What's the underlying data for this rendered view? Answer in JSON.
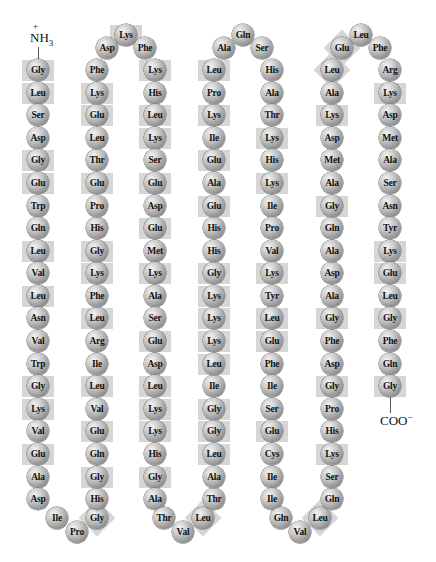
{
  "figure": {
    "n_terminus": {
      "label": "NH",
      "sub": "3",
      "charge": "+"
    },
    "c_terminus": {
      "label": "COO",
      "charge": "−"
    },
    "highlight_color": "#cfcfcf",
    "bead_color": "#a8a8a8",
    "residues": [
      {
        "aa": "Gly",
        "x": 38,
        "y": 70,
        "hl": true
      },
      {
        "aa": "Leu",
        "x": 38,
        "y": 93,
        "hl": true
      },
      {
        "aa": "Ser",
        "x": 38,
        "y": 115,
        "hl": false
      },
      {
        "aa": "Asp",
        "x": 38,
        "y": 138,
        "hl": false
      },
      {
        "aa": "Gly",
        "x": 38,
        "y": 160,
        "hl": true
      },
      {
        "aa": "Glu",
        "x": 38,
        "y": 183,
        "hl": true
      },
      {
        "aa": "Trp",
        "x": 38,
        "y": 206,
        "hl": false
      },
      {
        "aa": "Gln",
        "x": 38,
        "y": 228,
        "hl": false
      },
      {
        "aa": "Leu",
        "x": 38,
        "y": 251,
        "hl": true
      },
      {
        "aa": "Val",
        "x": 38,
        "y": 273,
        "hl": false
      },
      {
        "aa": "Leu",
        "x": 38,
        "y": 296,
        "hl": true
      },
      {
        "aa": "Asn",
        "x": 38,
        "y": 318,
        "hl": false
      },
      {
        "aa": "Val",
        "x": 38,
        "y": 341,
        "hl": false
      },
      {
        "aa": "Trp",
        "x": 38,
        "y": 364,
        "hl": false
      },
      {
        "aa": "Gly",
        "x": 38,
        "y": 386,
        "hl": true
      },
      {
        "aa": "Lys",
        "x": 38,
        "y": 409,
        "hl": true
      },
      {
        "aa": "Val",
        "x": 38,
        "y": 431,
        "hl": false
      },
      {
        "aa": "Glu",
        "x": 38,
        "y": 454,
        "hl": true
      },
      {
        "aa": "Ala",
        "x": 38,
        "y": 477,
        "hl": false
      },
      {
        "aa": "Asp",
        "x": 38,
        "y": 499,
        "hl": false
      },
      {
        "aa": "Ile",
        "x": 57,
        "y": 518,
        "hl": false
      },
      {
        "aa": "Pro",
        "x": 77,
        "y": 532,
        "hl": false
      },
      {
        "aa": "Gly",
        "x": 97,
        "y": 518,
        "hl": true,
        "rot": true
      },
      {
        "aa": "His",
        "x": 97,
        "y": 499,
        "hl": false
      },
      {
        "aa": "Gly",
        "x": 97,
        "y": 477,
        "hl": true
      },
      {
        "aa": "Gln",
        "x": 97,
        "y": 454,
        "hl": false
      },
      {
        "aa": "Glu",
        "x": 97,
        "y": 431,
        "hl": true
      },
      {
        "aa": "Val",
        "x": 97,
        "y": 409,
        "hl": false
      },
      {
        "aa": "Leu",
        "x": 97,
        "y": 386,
        "hl": true
      },
      {
        "aa": "Ile",
        "x": 97,
        "y": 364,
        "hl": false
      },
      {
        "aa": "Arg",
        "x": 97,
        "y": 341,
        "hl": false
      },
      {
        "aa": "Leu",
        "x": 97,
        "y": 318,
        "hl": true
      },
      {
        "aa": "Phe",
        "x": 97,
        "y": 296,
        "hl": false
      },
      {
        "aa": "Lys",
        "x": 97,
        "y": 273,
        "hl": true
      },
      {
        "aa": "Gly",
        "x": 97,
        "y": 251,
        "hl": true
      },
      {
        "aa": "His",
        "x": 97,
        "y": 228,
        "hl": false
      },
      {
        "aa": "Pro",
        "x": 97,
        "y": 206,
        "hl": false
      },
      {
        "aa": "Glu",
        "x": 97,
        "y": 183,
        "hl": true
      },
      {
        "aa": "Thr",
        "x": 97,
        "y": 160,
        "hl": false
      },
      {
        "aa": "Leu",
        "x": 97,
        "y": 138,
        "hl": false
      },
      {
        "aa": "Glu",
        "x": 97,
        "y": 115,
        "hl": true
      },
      {
        "aa": "Lys",
        "x": 97,
        "y": 93,
        "hl": true
      },
      {
        "aa": "Phe",
        "x": 97,
        "y": 70,
        "hl": false
      },
      {
        "aa": "Asp",
        "x": 107,
        "y": 48,
        "hl": false
      },
      {
        "aa": "Lys",
        "x": 126,
        "y": 35,
        "hl": true
      },
      {
        "aa": "Phe",
        "x": 145,
        "y": 48,
        "hl": false
      },
      {
        "aa": "Lys",
        "x": 155,
        "y": 70,
        "hl": true
      },
      {
        "aa": "His",
        "x": 155,
        "y": 93,
        "hl": false
      },
      {
        "aa": "Leu",
        "x": 155,
        "y": 115,
        "hl": true
      },
      {
        "aa": "Lys",
        "x": 155,
        "y": 138,
        "hl": true
      },
      {
        "aa": "Ser",
        "x": 155,
        "y": 160,
        "hl": false
      },
      {
        "aa": "Glu",
        "x": 155,
        "y": 183,
        "hl": true
      },
      {
        "aa": "Asp",
        "x": 155,
        "y": 206,
        "hl": false
      },
      {
        "aa": "Glu",
        "x": 155,
        "y": 228,
        "hl": true
      },
      {
        "aa": "Met",
        "x": 155,
        "y": 251,
        "hl": false
      },
      {
        "aa": "Lys",
        "x": 155,
        "y": 273,
        "hl": true
      },
      {
        "aa": "Ala",
        "x": 155,
        "y": 296,
        "hl": false
      },
      {
        "aa": "Ser",
        "x": 155,
        "y": 318,
        "hl": false
      },
      {
        "aa": "Glu",
        "x": 155,
        "y": 341,
        "hl": true
      },
      {
        "aa": "Asp",
        "x": 155,
        "y": 364,
        "hl": false
      },
      {
        "aa": "Leu",
        "x": 155,
        "y": 386,
        "hl": true
      },
      {
        "aa": "Lys",
        "x": 155,
        "y": 409,
        "hl": true
      },
      {
        "aa": "Lys",
        "x": 155,
        "y": 431,
        "hl": true
      },
      {
        "aa": "His",
        "x": 155,
        "y": 454,
        "hl": false
      },
      {
        "aa": "Gly",
        "x": 155,
        "y": 477,
        "hl": true
      },
      {
        "aa": "Ala",
        "x": 155,
        "y": 499,
        "hl": false
      },
      {
        "aa": "Thr",
        "x": 164,
        "y": 518,
        "hl": false
      },
      {
        "aa": "Val",
        "x": 183,
        "y": 532,
        "hl": false
      },
      {
        "aa": "Leu",
        "x": 203,
        "y": 518,
        "hl": true,
        "rot": true
      },
      {
        "aa": "Thr",
        "x": 214,
        "y": 499,
        "hl": false
      },
      {
        "aa": "Ala",
        "x": 214,
        "y": 477,
        "hl": false
      },
      {
        "aa": "Leu",
        "x": 214,
        "y": 454,
        "hl": true
      },
      {
        "aa": "Gly",
        "x": 214,
        "y": 431,
        "hl": true
      },
      {
        "aa": "Gly",
        "x": 214,
        "y": 409,
        "hl": true
      },
      {
        "aa": "Ile",
        "x": 214,
        "y": 386,
        "hl": false
      },
      {
        "aa": "Leu",
        "x": 214,
        "y": 364,
        "hl": true
      },
      {
        "aa": "Lys",
        "x": 214,
        "y": 341,
        "hl": true
      },
      {
        "aa": "Lys",
        "x": 214,
        "y": 318,
        "hl": true
      },
      {
        "aa": "Lys",
        "x": 214,
        "y": 296,
        "hl": true
      },
      {
        "aa": "Gly",
        "x": 214,
        "y": 273,
        "hl": true
      },
      {
        "aa": "His",
        "x": 214,
        "y": 251,
        "hl": false
      },
      {
        "aa": "His",
        "x": 214,
        "y": 228,
        "hl": false
      },
      {
        "aa": "Glu",
        "x": 214,
        "y": 206,
        "hl": true
      },
      {
        "aa": "Ala",
        "x": 214,
        "y": 183,
        "hl": false
      },
      {
        "aa": "Glu",
        "x": 214,
        "y": 160,
        "hl": true
      },
      {
        "aa": "Ile",
        "x": 214,
        "y": 138,
        "hl": false
      },
      {
        "aa": "Lys",
        "x": 214,
        "y": 115,
        "hl": true
      },
      {
        "aa": "Pro",
        "x": 214,
        "y": 93,
        "hl": false
      },
      {
        "aa": "Leu",
        "x": 214,
        "y": 70,
        "hl": true
      },
      {
        "aa": "Ala",
        "x": 224,
        "y": 48,
        "hl": false
      },
      {
        "aa": "Gln",
        "x": 243,
        "y": 35,
        "hl": false
      },
      {
        "aa": "Ser",
        "x": 262,
        "y": 48,
        "hl": false
      },
      {
        "aa": "His",
        "x": 272,
        "y": 70,
        "hl": false
      },
      {
        "aa": "Ala",
        "x": 272,
        "y": 93,
        "hl": false
      },
      {
        "aa": "Thr",
        "x": 272,
        "y": 115,
        "hl": false
      },
      {
        "aa": "Lys",
        "x": 272,
        "y": 138,
        "hl": true
      },
      {
        "aa": "His",
        "x": 272,
        "y": 160,
        "hl": false
      },
      {
        "aa": "Lys",
        "x": 272,
        "y": 183,
        "hl": true
      },
      {
        "aa": "Ile",
        "x": 272,
        "y": 206,
        "hl": false
      },
      {
        "aa": "Pro",
        "x": 272,
        "y": 228,
        "hl": false
      },
      {
        "aa": "Val",
        "x": 272,
        "y": 251,
        "hl": false
      },
      {
        "aa": "Lys",
        "x": 272,
        "y": 273,
        "hl": true
      },
      {
        "aa": "Tyr",
        "x": 272,
        "y": 296,
        "hl": false
      },
      {
        "aa": "Leu",
        "x": 272,
        "y": 318,
        "hl": true
      },
      {
        "aa": "Glu",
        "x": 272,
        "y": 341,
        "hl": true
      },
      {
        "aa": "Phe",
        "x": 272,
        "y": 364,
        "hl": false
      },
      {
        "aa": "Ile",
        "x": 272,
        "y": 386,
        "hl": false
      },
      {
        "aa": "Ser",
        "x": 272,
        "y": 409,
        "hl": false
      },
      {
        "aa": "Glu",
        "x": 272,
        "y": 431,
        "hl": true
      },
      {
        "aa": "Cys",
        "x": 272,
        "y": 454,
        "hl": false
      },
      {
        "aa": "Ile",
        "x": 272,
        "y": 477,
        "hl": false
      },
      {
        "aa": "Ile",
        "x": 272,
        "y": 499,
        "hl": false
      },
      {
        "aa": "Gln",
        "x": 281,
        "y": 518,
        "hl": false
      },
      {
        "aa": "Val",
        "x": 300,
        "y": 532,
        "hl": false
      },
      {
        "aa": "Leu",
        "x": 320,
        "y": 518,
        "hl": true,
        "rot": true
      },
      {
        "aa": "Gln",
        "x": 332,
        "y": 499,
        "hl": false
      },
      {
        "aa": "Ser",
        "x": 332,
        "y": 477,
        "hl": false
      },
      {
        "aa": "Lys",
        "x": 332,
        "y": 454,
        "hl": true
      },
      {
        "aa": "His",
        "x": 332,
        "y": 431,
        "hl": false
      },
      {
        "aa": "Pro",
        "x": 332,
        "y": 409,
        "hl": false
      },
      {
        "aa": "Gly",
        "x": 332,
        "y": 386,
        "hl": true
      },
      {
        "aa": "Asp",
        "x": 332,
        "y": 364,
        "hl": false
      },
      {
        "aa": "Phe",
        "x": 332,
        "y": 341,
        "hl": false
      },
      {
        "aa": "Gly",
        "x": 332,
        "y": 318,
        "hl": true
      },
      {
        "aa": "Ala",
        "x": 332,
        "y": 296,
        "hl": false
      },
      {
        "aa": "Asp",
        "x": 332,
        "y": 273,
        "hl": false
      },
      {
        "aa": "Ala",
        "x": 332,
        "y": 251,
        "hl": false
      },
      {
        "aa": "Gln",
        "x": 332,
        "y": 228,
        "hl": false
      },
      {
        "aa": "Gly",
        "x": 332,
        "y": 206,
        "hl": true
      },
      {
        "aa": "Ala",
        "x": 332,
        "y": 183,
        "hl": false
      },
      {
        "aa": "Met",
        "x": 332,
        "y": 160,
        "hl": false
      },
      {
        "aa": "Asp",
        "x": 332,
        "y": 138,
        "hl": false
      },
      {
        "aa": "Lys",
        "x": 332,
        "y": 115,
        "hl": true
      },
      {
        "aa": "Ala",
        "x": 332,
        "y": 93,
        "hl": false
      },
      {
        "aa": "Leu",
        "x": 332,
        "y": 70,
        "hl": true,
        "rot": true
      },
      {
        "aa": "Glu",
        "x": 342,
        "y": 48,
        "hl": true,
        "rot": true
      },
      {
        "aa": "Leu",
        "x": 361,
        "y": 35,
        "hl": false
      },
      {
        "aa": "Phe",
        "x": 380,
        "y": 48,
        "hl": false
      },
      {
        "aa": "Arg",
        "x": 390,
        "y": 70,
        "hl": false
      },
      {
        "aa": "Lys",
        "x": 390,
        "y": 93,
        "hl": true
      },
      {
        "aa": "Asp",
        "x": 390,
        "y": 115,
        "hl": false
      },
      {
        "aa": "Met",
        "x": 390,
        "y": 138,
        "hl": false
      },
      {
        "aa": "Ala",
        "x": 390,
        "y": 160,
        "hl": false
      },
      {
        "aa": "Ser",
        "x": 390,
        "y": 183,
        "hl": false
      },
      {
        "aa": "Asn",
        "x": 390,
        "y": 206,
        "hl": false
      },
      {
        "aa": "Tyr",
        "x": 390,
        "y": 228,
        "hl": false
      },
      {
        "aa": "Lys",
        "x": 390,
        "y": 251,
        "hl": true
      },
      {
        "aa": "Glu",
        "x": 390,
        "y": 273,
        "hl": true
      },
      {
        "aa": "Leu",
        "x": 390,
        "y": 296,
        "hl": false
      },
      {
        "aa": "Gly",
        "x": 390,
        "y": 318,
        "hl": true
      },
      {
        "aa": "Phe",
        "x": 390,
        "y": 341,
        "hl": false
      },
      {
        "aa": "Gln",
        "x": 390,
        "y": 364,
        "hl": false
      },
      {
        "aa": "Gly",
        "x": 390,
        "y": 386,
        "hl": true
      }
    ]
  }
}
